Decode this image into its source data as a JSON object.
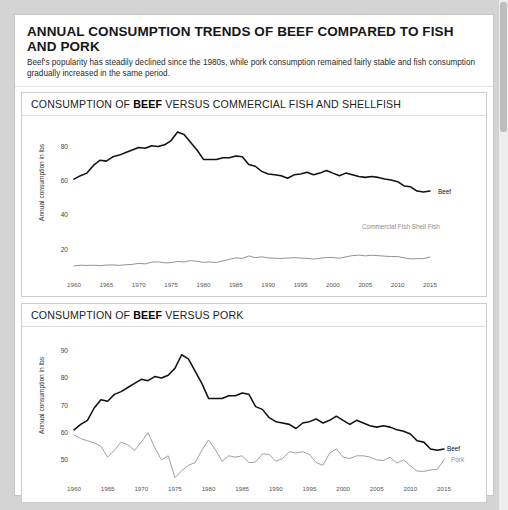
{
  "header": {
    "title": "ANNUAL CONSUMPTION TRENDS OF BEEF COMPARED TO FISH AND PORK",
    "subtitle": "Beef's popularity has steadily declined since the 1980s, while pork consumption remained fairly stable and fish consumption gradually increased in the same period."
  },
  "panel1": {
    "title_prefix": "CONSUMPTION OF ",
    "title_bold": "BEEF",
    "title_suffix": " VERSUS COMMERCIAL FISH AND SHELLFISH",
    "ylabel": "Annual consumption in lbs"
  },
  "panel2": {
    "title_prefix": "CONSUMPTION OF ",
    "title_bold": "BEEF",
    "title_suffix": " VERSUS PORK",
    "ylabel": "Annual consumption in lbs"
  },
  "colors": {
    "beef": "#111111",
    "fish": "#8c8c8c",
    "pork": "#9a9a9a",
    "card": "#ffffff",
    "page": "#d4d4d4",
    "border": "#cdcdcd"
  },
  "chart_data": [
    {
      "type": "line",
      "title": "CONSUMPTION OF BEEF VERSUS COMMERCIAL FISH AND SHELLFISH",
      "xlabel": "",
      "ylabel": "Annual consumption in lbs",
      "xlim": [
        1960,
        2015
      ],
      "ylim": [
        5,
        92
      ],
      "yticks": [
        20,
        40,
        60,
        80
      ],
      "xticks": [
        1960,
        1965,
        1970,
        1975,
        1980,
        1985,
        1990,
        1995,
        2000,
        2005,
        2010,
        2015
      ],
      "grid": false,
      "legend_position": "right-inline",
      "x": [
        1960,
        1961,
        1962,
        1963,
        1964,
        1965,
        1966,
        1967,
        1968,
        1969,
        1970,
        1971,
        1972,
        1973,
        1974,
        1975,
        1976,
        1977,
        1978,
        1979,
        1980,
        1981,
        1982,
        1983,
        1984,
        1985,
        1986,
        1987,
        1988,
        1989,
        1990,
        1991,
        1992,
        1993,
        1994,
        1995,
        1996,
        1997,
        1998,
        1999,
        2000,
        2001,
        2002,
        2003,
        2004,
        2005,
        2006,
        2007,
        2008,
        2009,
        2010,
        2011,
        2012,
        2013,
        2014,
        2015
      ],
      "series": [
        {
          "name": "Beef",
          "label": "Beef",
          "color": "#111111",
          "values": [
            61.0,
            63.0,
            64.5,
            69.0,
            72.0,
            71.5,
            74.0,
            75.0,
            76.5,
            78.0,
            79.5,
            79.0,
            80.5,
            80.0,
            81.0,
            83.5,
            88.5,
            87.0,
            82.5,
            78.0,
            72.5,
            72.5,
            72.5,
            73.5,
            73.5,
            74.5,
            74.0,
            69.5,
            68.5,
            65.5,
            64.0,
            63.5,
            63.0,
            61.5,
            63.5,
            64.0,
            65.0,
            63.5,
            64.5,
            66.0,
            64.5,
            63.0,
            64.5,
            63.5,
            62.5,
            62.0,
            62.5,
            62.0,
            61.0,
            60.5,
            59.5,
            57.0,
            56.5,
            54.0,
            53.5,
            54.0
          ]
        },
        {
          "name": "Commercial Fish Shell Fish",
          "label": "Commercial Fish Shell Fish",
          "color": "#8c8c8c",
          "values": [
            10.3,
            10.7,
            10.6,
            10.7,
            10.5,
            10.8,
            10.9,
            10.6,
            11.0,
            11.2,
            11.8,
            11.5,
            12.5,
            12.7,
            12.1,
            12.2,
            12.9,
            12.6,
            13.4,
            13.0,
            12.4,
            12.6,
            12.3,
            13.3,
            14.1,
            15.0,
            14.7,
            16.1,
            15.1,
            15.6,
            15.0,
            14.8,
            14.7,
            14.9,
            15.1,
            14.9,
            14.7,
            14.3,
            14.8,
            15.2,
            15.2,
            14.8,
            15.6,
            16.3,
            16.6,
            16.2,
            16.5,
            16.3,
            16.0,
            15.8,
            15.8,
            15.0,
            14.4,
            14.5,
            14.6,
            15.5
          ]
        }
      ]
    },
    {
      "type": "line",
      "title": "CONSUMPTION OF BEEF VERSUS PORK",
      "xlabel": "",
      "ylabel": "Annual consumption in lbs",
      "xlim": [
        1960,
        2015
      ],
      "ylim": [
        43,
        95
      ],
      "yticks": [
        50,
        60,
        70,
        80,
        90
      ],
      "xticks": [
        1960,
        1965,
        1970,
        1975,
        1980,
        1985,
        1990,
        1995,
        2000,
        2005,
        2010,
        2015
      ],
      "grid": false,
      "legend_position": "right-inline",
      "x": [
        1960,
        1961,
        1962,
        1963,
        1964,
        1965,
        1966,
        1967,
        1968,
        1969,
        1970,
        1971,
        1972,
        1973,
        1974,
        1975,
        1976,
        1977,
        1978,
        1979,
        1980,
        1981,
        1982,
        1983,
        1984,
        1985,
        1986,
        1987,
        1988,
        1989,
        1990,
        1991,
        1992,
        1993,
        1994,
        1995,
        1996,
        1997,
        1998,
        1999,
        2000,
        2001,
        2002,
        2003,
        2004,
        2005,
        2006,
        2007,
        2008,
        2009,
        2010,
        2011,
        2012,
        2013,
        2014,
        2015
      ],
      "series": [
        {
          "name": "Beef",
          "label": "Beef",
          "color": "#111111",
          "values": [
            61.0,
            63.0,
            64.5,
            69.0,
            72.0,
            71.5,
            74.0,
            75.0,
            76.5,
            78.0,
            79.5,
            79.0,
            80.5,
            80.0,
            81.0,
            83.5,
            88.5,
            87.0,
            82.5,
            78.0,
            72.5,
            72.5,
            72.5,
            73.5,
            73.5,
            74.5,
            74.0,
            69.5,
            68.5,
            65.5,
            64.0,
            63.5,
            63.0,
            61.5,
            63.5,
            64.0,
            65.0,
            63.5,
            64.5,
            66.0,
            64.5,
            63.0,
            64.5,
            63.5,
            62.5,
            62.0,
            62.5,
            62.0,
            61.0,
            60.5,
            59.5,
            57.0,
            56.5,
            54.0,
            53.5,
            54.0
          ]
        },
        {
          "name": "Pork",
          "label": "Pork",
          "color": "#9a9a9a",
          "values": [
            59.1,
            57.8,
            57.0,
            56.2,
            55.0,
            51.0,
            53.5,
            56.5,
            55.5,
            53.5,
            56.5,
            60.0,
            54.5,
            50.0,
            51.5,
            43.5,
            46.0,
            48.0,
            49.0,
            53.5,
            57.3,
            53.8,
            49.5,
            51.5,
            51.0,
            51.5,
            49.0,
            49.2,
            52.2,
            52.0,
            49.5,
            50.5,
            53.0,
            52.5,
            53.0,
            52.0,
            49.0,
            48.0,
            52.5,
            54.0,
            51.0,
            50.5,
            51.5,
            51.5,
            51.0,
            50.0,
            49.8,
            51.0,
            48.8,
            50.0,
            47.8,
            45.9,
            45.8,
            46.3,
            46.5,
            50.0
          ]
        }
      ]
    }
  ]
}
